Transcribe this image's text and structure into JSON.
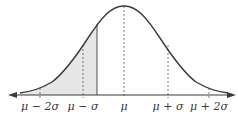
{
  "figure": {
    "type": "normal-distribution-curve",
    "shaded_region": "left tail up to a point between mu - sigma and mu",
    "colors": {
      "curve": "#3a3a3a",
      "axis": "#3a3a3a",
      "shade": "#e6e6e6",
      "dashed": "#555555"
    }
  },
  "axis": {
    "ticks": [
      {
        "id": "mu-minus-2sigma",
        "label": "μ − 2σ",
        "x": 40
      },
      {
        "id": "mu-minus-sigma",
        "label": "μ − σ",
        "x": 83
      },
      {
        "id": "mu",
        "label": "μ",
        "x": 124
      },
      {
        "id": "mu-plus-sigma",
        "label": "μ + σ",
        "x": 168
      },
      {
        "id": "mu-plus-2sigma",
        "label": "μ + 2σ",
        "x": 209
      }
    ]
  }
}
